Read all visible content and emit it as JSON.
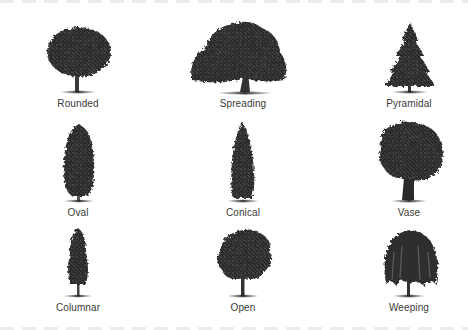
{
  "trees": [
    {
      "label": "Rounded",
      "shape": "rounded"
    },
    {
      "label": "Spreading",
      "shape": "spreading"
    },
    {
      "label": "Pyramidal",
      "shape": "pyramidal"
    },
    {
      "label": "Oval",
      "shape": "oval"
    },
    {
      "label": "Conical",
      "shape": "conical"
    },
    {
      "label": "Vase",
      "shape": "vase"
    },
    {
      "label": "Columnar",
      "shape": "columnar"
    },
    {
      "label": "Open",
      "shape": "open"
    },
    {
      "label": "Weeping",
      "shape": "weeping"
    }
  ],
  "colors": {
    "foliage": "#2b2b2b",
    "foliage_light": "#5a5a5a",
    "trunk": "#3a3a3a",
    "label": "#3a3a3a",
    "background": "#ffffff"
  }
}
